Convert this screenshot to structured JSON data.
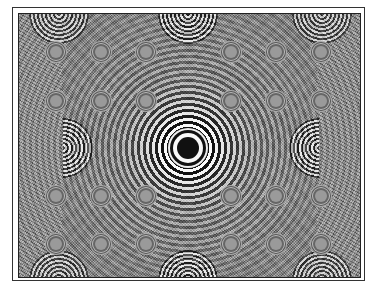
{
  "image": {
    "description": "Zone-plate interference test pattern with concentric rings",
    "width": 375,
    "height": 289,
    "colors": {
      "background": "#ffffff",
      "frame_border": "#222222",
      "mid_gray": "#888888",
      "ring_dark": "#111111",
      "ring_light": "#fafafa"
    },
    "main_center": {
      "x": 187,
      "y": 147
    },
    "secondary_ring_grid": {
      "spacing_x": 45,
      "spacing_y": 48
    },
    "secondary_rings": [
      {
        "x": 55,
        "y": 51
      },
      {
        "x": 100,
        "y": 51
      },
      {
        "x": 145,
        "y": 51
      },
      {
        "x": 230,
        "y": 51
      },
      {
        "x": 275,
        "y": 51
      },
      {
        "x": 320,
        "y": 51
      },
      {
        "x": 55,
        "y": 100
      },
      {
        "x": 100,
        "y": 100
      },
      {
        "x": 145,
        "y": 100
      },
      {
        "x": 230,
        "y": 100
      },
      {
        "x": 275,
        "y": 100
      },
      {
        "x": 320,
        "y": 100
      },
      {
        "x": 55,
        "y": 195
      },
      {
        "x": 100,
        "y": 195
      },
      {
        "x": 145,
        "y": 195
      },
      {
        "x": 230,
        "y": 195
      },
      {
        "x": 275,
        "y": 195
      },
      {
        "x": 320,
        "y": 195
      },
      {
        "x": 55,
        "y": 243
      },
      {
        "x": 100,
        "y": 243
      },
      {
        "x": 145,
        "y": 243
      },
      {
        "x": 230,
        "y": 243
      },
      {
        "x": 275,
        "y": 243
      },
      {
        "x": 320,
        "y": 243
      }
    ]
  }
}
